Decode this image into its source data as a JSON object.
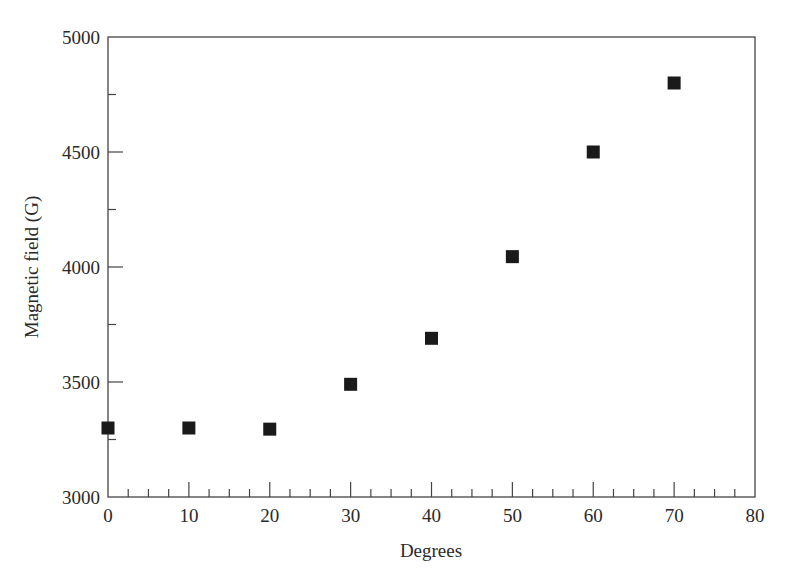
{
  "chart_data": {
    "type": "scatter",
    "title": "",
    "xlabel": "Degrees",
    "ylabel": "Magnetic field (G)",
    "xlim": [
      0,
      80
    ],
    "ylim": [
      3000,
      5000
    ],
    "x_ticks": [
      0,
      10,
      20,
      30,
      40,
      50,
      60,
      70,
      80
    ],
    "x_minor_step": 2.5,
    "y_ticks": [
      3000,
      3500,
      4000,
      4500,
      5000
    ],
    "y_minor_step": 250,
    "grid": false,
    "legend": null,
    "marker": "square",
    "marker_color": "#1a1a1a",
    "series": [
      {
        "name": "Magnetic field",
        "x": [
          0,
          10,
          20,
          30,
          40,
          50,
          60,
          70
        ],
        "y": [
          3300,
          3300,
          3295,
          3490,
          3690,
          4045,
          4500,
          4800
        ]
      }
    ]
  },
  "layout": {
    "plot_left": 108,
    "plot_right": 755,
    "plot_top": 37,
    "plot_bottom": 497
  }
}
